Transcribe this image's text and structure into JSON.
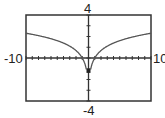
{
  "chart_data": {
    "type": "line",
    "title": "",
    "xlabel": "",
    "ylabel": "",
    "xlim": [
      -10,
      10
    ],
    "ylim": [
      -4,
      4
    ],
    "grid": false,
    "x_tick_labels": {
      "min": "-10",
      "max": "10"
    },
    "y_tick_labels": {
      "min": "-4",
      "max": "4"
    },
    "series": [
      {
        "name": "y = ln|x|",
        "x": [
          -10,
          -5,
          -2,
          -1,
          -0.5,
          -0.3,
          0.3,
          0.5,
          1,
          2,
          5,
          10
        ],
        "values": [
          2.3,
          1.61,
          0.69,
          0,
          -0.69,
          -1.2,
          -1.2,
          -0.69,
          0,
          0.69,
          1.61,
          2.3
        ]
      }
    ]
  },
  "labels": {
    "ymax": "4",
    "ymin": "-4",
    "xmin": "-10",
    "xmax": "10"
  }
}
